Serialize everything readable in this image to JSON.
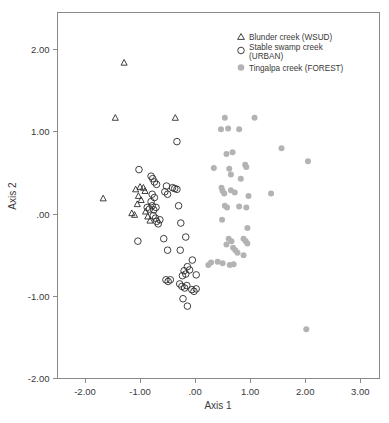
{
  "figure": {
    "width": 389,
    "height": 423,
    "background": "#ffffff"
  },
  "chart_data": {
    "type": "scatter",
    "title": "",
    "xlabel": "Axis 1",
    "ylabel": "Axis 2",
    "xlim": [
      -2.5,
      3.35
    ],
    "ylim": [
      -2.0,
      2.45
    ],
    "xticks": [
      -2.0,
      -1.0,
      0.0,
      1.0,
      2.0,
      3.0
    ],
    "xticklabels": [
      "-2.00",
      "-1.00",
      ".00",
      "1.00",
      "2.00",
      "3.00"
    ],
    "yticks": [
      2.0,
      1.0,
      0.0,
      -1.0,
      -2.0
    ],
    "yticklabels": [
      "2.00",
      "1.00",
      ".00",
      "-1.00",
      "-2.00"
    ],
    "grid": false,
    "legend_position": "top-right",
    "marker_colors": {
      "open_stroke": "#2b2b2b",
      "filled": "#b3b3b3",
      "frame": "#8a8a8a",
      "text": "#3a3a3a"
    },
    "series": [
      {
        "name": "Blunder creek (WSUD)",
        "marker": "triangle-open",
        "color": "#2b2b2b",
        "points": [
          [
            -1.29,
            1.84
          ],
          [
            -1.45,
            1.17
          ],
          [
            -0.36,
            1.17
          ],
          [
            -1.67,
            0.19
          ],
          [
            -1.08,
            0.3
          ],
          [
            -1.0,
            0.33
          ],
          [
            -0.94,
            0.32
          ],
          [
            -0.91,
            0.28
          ],
          [
            -1.03,
            0.22
          ],
          [
            -0.98,
            0.17
          ],
          [
            -1.05,
            0.12
          ],
          [
            -1.15,
            0.01
          ],
          [
            -1.1,
            -0.01
          ],
          [
            -0.9,
            0.03
          ],
          [
            -0.86,
            -0.03
          ],
          [
            -0.82,
            -0.08
          ]
        ]
      },
      {
        "name": "Stable swamp creek (URBAN)",
        "marker": "circle-open",
        "color": "#2b2b2b",
        "points": [
          [
            -0.33,
            0.88
          ],
          [
            -1.02,
            0.54
          ],
          [
            -0.8,
            0.46
          ],
          [
            -0.77,
            0.43
          ],
          [
            -0.74,
            0.39
          ],
          [
            -0.7,
            0.36
          ],
          [
            -0.52,
            0.34
          ],
          [
            -0.41,
            0.32
          ],
          [
            -0.37,
            0.31
          ],
          [
            -0.33,
            0.3
          ],
          [
            -0.55,
            0.27
          ],
          [
            -0.5,
            0.24
          ],
          [
            -0.78,
            0.24
          ],
          [
            -0.74,
            0.2
          ],
          [
            -0.8,
            0.15
          ],
          [
            -0.87,
            0.08
          ],
          [
            -0.83,
            0.06
          ],
          [
            -0.78,
            0.1
          ],
          [
            -0.75,
            0.05
          ],
          [
            -0.71,
            0.08
          ],
          [
            -0.3,
            0.1
          ],
          [
            -0.76,
            -0.02
          ],
          [
            -0.72,
            -0.05
          ],
          [
            -0.7,
            -0.09
          ],
          [
            -0.67,
            -0.12
          ],
          [
            -0.64,
            -0.07
          ],
          [
            -0.26,
            -0.11
          ],
          [
            -1.04,
            -0.33
          ],
          [
            -0.57,
            -0.3
          ],
          [
            -0.17,
            -0.28
          ],
          [
            -0.5,
            -0.44
          ],
          [
            -0.27,
            -0.44
          ],
          [
            -0.05,
            -0.56
          ],
          [
            -0.14,
            -0.64
          ],
          [
            -0.1,
            -0.68
          ],
          [
            -0.2,
            -0.69
          ],
          [
            -0.17,
            -0.73
          ],
          [
            -0.23,
            -0.75
          ],
          [
            0.02,
            -0.74
          ],
          [
            -0.53,
            -0.8
          ],
          [
            -0.49,
            -0.82
          ],
          [
            -0.45,
            -0.8
          ],
          [
            -0.28,
            -0.85
          ],
          [
            -0.24,
            -0.88
          ],
          [
            -0.19,
            -0.9
          ],
          [
            -0.15,
            -0.87
          ],
          [
            -0.06,
            -0.92
          ],
          [
            -0.02,
            -0.94
          ],
          [
            0.02,
            -0.91
          ],
          [
            -0.22,
            -1.03
          ],
          [
            -0.14,
            -1.12
          ]
        ]
      },
      {
        "name": "Tingalpa creek (FOREST)",
        "marker": "circle-filled",
        "color": "#b3b3b3",
        "points": [
          [
            0.54,
            1.17
          ],
          [
            1.08,
            1.17
          ],
          [
            0.47,
            1.03
          ],
          [
            0.6,
            1.04
          ],
          [
            0.8,
            1.03
          ],
          [
            0.57,
            0.73
          ],
          [
            0.68,
            0.75
          ],
          [
            1.57,
            0.8
          ],
          [
            2.05,
            0.64
          ],
          [
            0.34,
            0.56
          ],
          [
            0.62,
            0.55
          ],
          [
            0.91,
            0.6
          ],
          [
            0.93,
            0.57
          ],
          [
            0.65,
            0.48
          ],
          [
            0.83,
            0.43
          ],
          [
            0.48,
            0.32
          ],
          [
            0.5,
            0.28
          ],
          [
            0.53,
            0.25
          ],
          [
            0.65,
            0.29
          ],
          [
            0.72,
            0.26
          ],
          [
            0.97,
            0.22
          ],
          [
            1.38,
            0.25
          ],
          [
            0.54,
            0.1
          ],
          [
            0.58,
            0.08
          ],
          [
            0.8,
            0.09
          ],
          [
            0.93,
            0.08
          ],
          [
            0.49,
            -0.07
          ],
          [
            0.95,
            -0.17
          ],
          [
            0.61,
            -0.3
          ],
          [
            0.66,
            -0.33
          ],
          [
            0.88,
            -0.3
          ],
          [
            0.92,
            -0.33
          ],
          [
            0.95,
            -0.36
          ],
          [
            0.57,
            -0.37
          ],
          [
            0.69,
            -0.41
          ],
          [
            0.73,
            -0.44
          ],
          [
            0.77,
            -0.47
          ],
          [
            0.88,
            -0.5
          ],
          [
            0.29,
            -0.59
          ],
          [
            0.41,
            -0.58
          ],
          [
            0.5,
            -0.6
          ],
          [
            0.63,
            -0.62
          ],
          [
            0.7,
            -0.61
          ],
          [
            0.24,
            -0.62
          ],
          [
            2.02,
            -1.4
          ]
        ]
      }
    ]
  },
  "legend": {
    "items": [
      {
        "label": "Blunder creek (WSUD)",
        "marker": "triangle-open"
      },
      {
        "label": "Stable swamp creek",
        "label2": "(URBAN)",
        "marker": "circle-open"
      },
      {
        "label": "Tingalpa creek (FOREST)",
        "marker": "circle-filled"
      }
    ]
  }
}
